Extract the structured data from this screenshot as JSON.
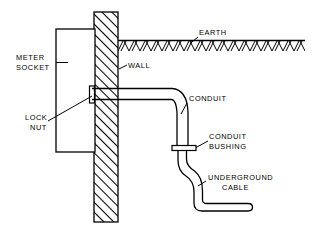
{
  "diagram": {
    "background_color": "#ffffff",
    "line_color": "#000000",
    "labels": {
      "earth": "EARTH",
      "wall": "WALL",
      "meter_socket_line1": "METER",
      "meter_socket_line2": "SOCKET",
      "lock_nut_line1": "LOCK",
      "lock_nut_line2": "NUT",
      "conduit": "CONDUIT",
      "conduit_bushing_line1": "CONDUIT",
      "conduit_bushing_line2": "BUSHING",
      "underground_cable_line1": "UNDERGROUND",
      "underground_cable_line2": "CABLE"
    },
    "parts": [
      {
        "name": "meter-socket",
        "label": "METER SOCKET",
        "shape": "rectangle"
      },
      {
        "name": "wall",
        "label": "WALL",
        "shape": "hatched-vertical-band"
      },
      {
        "name": "earth",
        "label": "EARTH",
        "shape": "chevron-hatched-ground-band"
      },
      {
        "name": "lock-nut",
        "label": "LOCK NUT",
        "shape": "small-flange"
      },
      {
        "name": "conduit",
        "label": "CONDUIT",
        "shape": "elbow-pipe"
      },
      {
        "name": "conduit-bushing",
        "label": "CONDUIT BUSHING",
        "shape": "flange-plate"
      },
      {
        "name": "underground-cable",
        "label": "UNDERGROUND CABLE",
        "shape": "s-curve-cable"
      }
    ]
  }
}
